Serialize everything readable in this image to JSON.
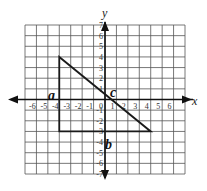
{
  "diagram": {
    "type": "coordinate-plane",
    "axes": {
      "x_label": "x",
      "y_label": "y",
      "x_range": [
        -7,
        7
      ],
      "y_range": [
        -7,
        7
      ],
      "x_ticks": [
        "-6",
        "-5",
        "-4",
        "-3",
        "-2",
        "-1",
        "0",
        "1",
        "2",
        "3",
        "4",
        "5",
        "6"
      ],
      "y_ticks": [
        "7",
        "6",
        "5",
        "4",
        "3",
        "2",
        "1",
        "-1",
        "-2",
        "-3",
        "-4",
        "-5",
        "-6",
        "-7"
      ]
    },
    "triangle": {
      "vertices": [
        [
          -4,
          4
        ],
        [
          -4,
          -3
        ],
        [
          4,
          -3
        ]
      ],
      "side_labels": [
        {
          "label": "a",
          "side": "vertical leg x=-4"
        },
        {
          "label": "b",
          "side": "horizontal leg y=-3"
        },
        {
          "label": "c",
          "side": "hypotenuse"
        }
      ]
    },
    "colors": {
      "grid": "#555555",
      "axis": "#111111",
      "triangle": "#1a1a1a",
      "background": "#ffffff"
    }
  }
}
